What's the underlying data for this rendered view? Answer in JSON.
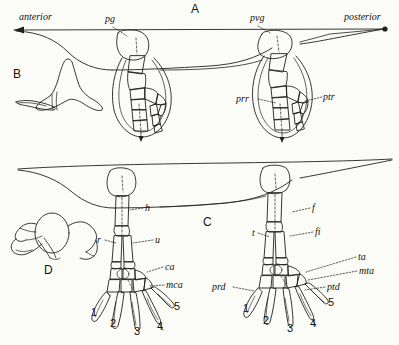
{
  "figure": {
    "panels": [
      {
        "id": "A",
        "label": "A",
        "caption_role": "whole-animal-axis-panel"
      },
      {
        "id": "B",
        "label": "B",
        "caption_role": "pectoral-girdle-inset"
      },
      {
        "id": "C",
        "label": "C",
        "caption_role": "hindlimb-panel"
      },
      {
        "id": "D",
        "label": "D",
        "caption_role": "pelvic-girdle-inset"
      }
    ],
    "axis": {
      "anterior_label": "anterior",
      "posterior_label": "posterior"
    },
    "annotations_top": [
      {
        "key": "pg",
        "text": "pg",
        "meaning_role": "pectoral-girdle"
      },
      {
        "key": "pvg",
        "text": "pvg",
        "meaning_role": "pelvic-girdle"
      },
      {
        "key": "prr",
        "text": "prr",
        "meaning_role": "proximal-row"
      },
      {
        "key": "ptr",
        "text": "ptr",
        "meaning_role": "distal-row"
      }
    ],
    "annotations_forelimb": [
      {
        "key": "h",
        "text": "h",
        "meaning_role": "humerus"
      },
      {
        "key": "r",
        "text": "r",
        "meaning_role": "radius"
      },
      {
        "key": "u",
        "text": "u",
        "meaning_role": "ulna"
      },
      {
        "key": "ca",
        "text": "ca",
        "meaning_role": "carpals"
      },
      {
        "key": "mca",
        "text": "mca",
        "meaning_role": "metacarpals"
      }
    ],
    "annotations_hindlimb": [
      {
        "key": "f",
        "text": "f",
        "meaning_role": "femur"
      },
      {
        "key": "t",
        "text": "t",
        "meaning_role": "tibia"
      },
      {
        "key": "fi",
        "text": "fi",
        "meaning_role": "fibula"
      },
      {
        "key": "ta",
        "text": "ta",
        "meaning_role": "tarsals"
      },
      {
        "key": "mta",
        "text": "mta",
        "meaning_role": "metatarsals"
      },
      {
        "key": "prd",
        "text": "prd",
        "meaning_role": "proximal-digit"
      },
      {
        "key": "ptd",
        "text": "ptd",
        "meaning_role": "distal-digit"
      }
    ],
    "digits_forelimb": [
      "1",
      "2",
      "3",
      "4",
      "5"
    ],
    "digits_hindlimb": [
      "1",
      "2",
      "3",
      "4",
      "5"
    ],
    "colors": {
      "background": "#fbfbf8",
      "ink": "#15130f",
      "line": "#20201c"
    }
  }
}
